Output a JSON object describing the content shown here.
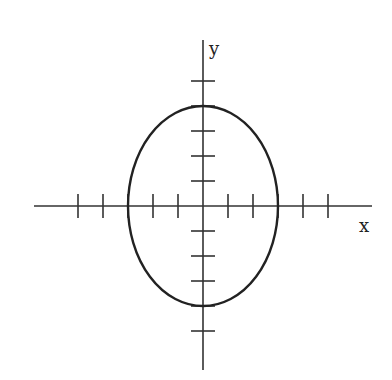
{
  "diagram": {
    "type": "ellipse-on-axes",
    "axes": {
      "x_label": "x",
      "y_label": "y",
      "origin_px": [
        203,
        206
      ],
      "unit_px": 25,
      "x_range_px": [
        34,
        372
      ],
      "y_range_px": [
        40,
        370
      ],
      "x_ticks": [
        -5,
        -4,
        -3,
        -2,
        -1,
        1,
        2,
        3,
        4,
        5
      ],
      "y_ticks": [
        5,
        4,
        3,
        2,
        1,
        -1,
        -2,
        -3,
        -4,
        -5
      ]
    },
    "ellipse": {
      "center": [
        0,
        0
      ],
      "semi_axis_x": 3,
      "semi_axis_y": 4,
      "equation": "x^2/9 + y^2/16 = 1"
    },
    "colors": {
      "stroke": "#222222",
      "background": "#ffffff"
    }
  }
}
